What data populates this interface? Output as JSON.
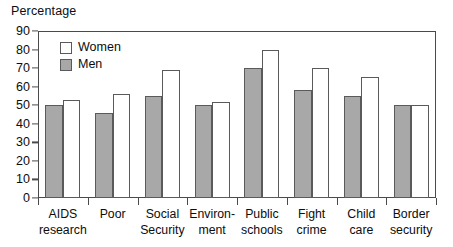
{
  "chart_data": {
    "type": "bar",
    "title": "Percentage",
    "xlabel": "",
    "ylabel": "Percentage",
    "ylim": [
      0,
      90
    ],
    "yticks": [
      0,
      10,
      20,
      30,
      40,
      50,
      60,
      70,
      80,
      90
    ],
    "grid": false,
    "legend_position": "top-left",
    "categories": [
      "AIDS research",
      "Poor",
      "Social Security",
      "Environment",
      "Public schools",
      "Fight crime",
      "Child care",
      "Border security"
    ],
    "category_lines": [
      [
        "AIDS",
        "research"
      ],
      [
        "Poor"
      ],
      [
        "Social",
        "Security"
      ],
      [
        "Environ-",
        "ment"
      ],
      [
        "Public",
        "schools"
      ],
      [
        "Fight",
        "crime"
      ],
      [
        "Child",
        "care"
      ],
      [
        "Border",
        "security"
      ]
    ],
    "series": [
      {
        "name": "Women",
        "color": "#ffffff",
        "values": [
          53,
          56,
          69,
          52,
          80,
          70,
          65,
          50
        ]
      },
      {
        "name": "Men",
        "color": "#a8a8a8",
        "values": [
          50,
          46,
          55,
          50,
          70,
          58,
          55,
          50
        ]
      }
    ]
  },
  "legend": {
    "items": [
      {
        "label": "Women",
        "swatch": "women"
      },
      {
        "label": "Men",
        "swatch": "men"
      }
    ]
  },
  "colors": {
    "men_fill": "#a8a8a8",
    "women_fill": "#ffffff",
    "bar_stroke": "#5a5a5a",
    "axis": "#4a4a4a",
    "text": "#0d0d0d"
  }
}
